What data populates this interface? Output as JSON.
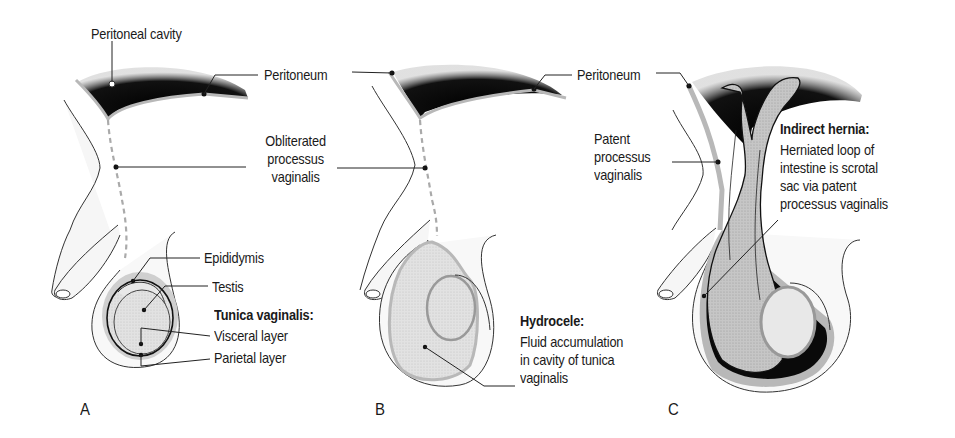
{
  "figure": {
    "colors": {
      "cavity": "#0a0a0a",
      "membrane": "#b8b8b8",
      "tissue_fill": "#f6f6f6",
      "testis_fill": "#e4e4e4",
      "intestine_fill": "#c4c4c4",
      "outline": "#2a2a2a",
      "text": "#1a1a1a"
    },
    "panels": [
      {
        "letter": "A",
        "labels": {
          "peritoneal_cavity": "Peritoneal cavity",
          "peritoneum": "Peritoneum",
          "obliterated_pv": [
            "Obliterated",
            "processus",
            "vaginalis"
          ],
          "epididymis": "Epididymis",
          "testis": "Testis",
          "tunica_title": "Tunica vaginalis:",
          "visceral": "Visceral layer",
          "parietal": "Parietal layer"
        }
      },
      {
        "letter": "B",
        "labels": {
          "peritoneum": "Peritoneum",
          "hydrocele_title": "Hydrocele:",
          "hydrocele_desc": [
            "Fluid accumulation",
            "in cavity of tunica",
            "vaginalis"
          ]
        }
      },
      {
        "letter": "C",
        "labels": {
          "patent_pv": [
            "Patent",
            "processus",
            "vaginalis"
          ],
          "hernia_title": "Indirect hernia:",
          "hernia_desc": [
            "Herniated loop of",
            "intestine is scrotal",
            "sac via patent",
            "processus vaginalis"
          ]
        }
      }
    ]
  }
}
